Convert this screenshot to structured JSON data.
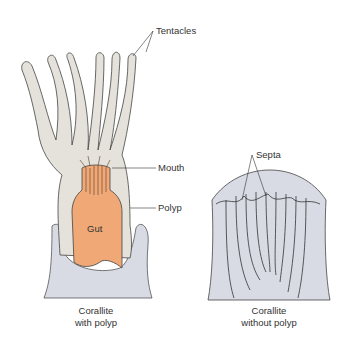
{
  "labels": {
    "tentacles": "Tentacles",
    "mouth": "Mouth",
    "polyp": "Polyp",
    "gut": "Gut",
    "septa": "Septa"
  },
  "captions": {
    "left_line1": "Corallite",
    "left_line2": "with polyp",
    "right_line1": "Corallite",
    "right_line2": "without polyp"
  },
  "colors": {
    "polyp": "#e4e2da",
    "gut": "#f0a877",
    "corallite": "#d8dbe4",
    "outline": "#333333"
  }
}
